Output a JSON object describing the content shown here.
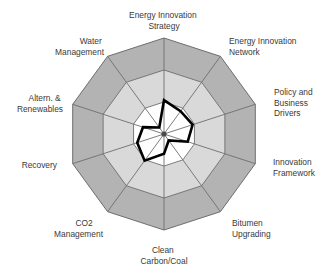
{
  "chart_data": {
    "type": "radar",
    "title": "",
    "subtitle": "",
    "xlabel": "",
    "ylabel": "",
    "grid": true,
    "legend_position": "none",
    "axis_range": [
      0,
      3
    ],
    "ring_count": 3,
    "categories": [
      "Energy Innovation Strategy",
      "Energy Innovation Network",
      "Policy and Business Drivers",
      "Innovation Framework",
      "Bitumen Upgrading",
      "Clean Carbon/Coal",
      "CO2 Management",
      "Recovery",
      "Altern. & Renewables",
      "Water Management"
    ],
    "series": [
      {
        "name": "Current Position",
        "values": [
          1.06,
          0.88,
          0.94,
          0.78,
          0.25,
          0.62,
          1.03,
          0.88,
          0.69,
          0.25
        ]
      }
    ],
    "bands": [
      {
        "name": "inner",
        "from": 0,
        "to": 1,
        "color": "#ffffff"
      },
      {
        "name": "middle",
        "from": 1,
        "to": 2,
        "color": "#d9d9d9"
      },
      {
        "name": "outer",
        "from": 2,
        "to": 3,
        "color": "#b0b0b0"
      }
    ],
    "series_color": "#000000",
    "grid_color": "#6e6e6e",
    "label_color": "#3a3a3a"
  },
  "labels": {
    "energy_innovation_strategy": [
      "Energy Innovation",
      "Strategy"
    ],
    "energy_innovation_network": [
      "Energy Innovation",
      "Network"
    ],
    "policy_and_business_drivers": [
      "Policy and",
      "Business",
      "Drivers"
    ],
    "innovation_framework": [
      "Innovation",
      "Framework"
    ],
    "bitumen_upgrading": [
      "Bitumen",
      "Upgrading"
    ],
    "clean_carbon_coal": [
      "Clean",
      "Carbon/Coal"
    ],
    "co2_management": [
      "CO2",
      "Management"
    ],
    "recovery": [
      "Recovery"
    ],
    "altern_renewables": [
      "Altern. &",
      "Renewables"
    ],
    "water_management": [
      "Water",
      "Management"
    ]
  },
  "label_lines": {
    "l0a": "Energy Innovation",
    "l0b": "Strategy",
    "l1a": "Energy Innovation",
    "l1b": "Network",
    "l2a": "Policy and",
    "l2b": "Business",
    "l2c": "Drivers",
    "l3a": "Innovation",
    "l3b": "Framework",
    "l4a": "Bitumen",
    "l4b": "Upgrading",
    "l5a": "Clean",
    "l5b": "Carbon/Coal",
    "l6a": "CO2",
    "l6b": "Management",
    "l7a": "Recovery",
    "l8a": "Altern. &",
    "l8b": "Renewables",
    "l9a": "Water",
    "l9b": "Management"
  }
}
